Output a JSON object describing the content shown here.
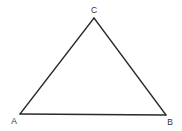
{
  "diagram": {
    "type": "triangle",
    "vertices": [
      {
        "label": "A",
        "x": 20,
        "y": 114,
        "label_x": 14,
        "label_y": 122
      },
      {
        "label": "B",
        "x": 166,
        "y": 115,
        "label_x": 170,
        "label_y": 123
      },
      {
        "label": "C",
        "x": 94,
        "y": 18,
        "label_x": 94,
        "label_y": 11
      }
    ],
    "edges": [
      {
        "from": "A",
        "to": "B"
      },
      {
        "from": "B",
        "to": "C"
      },
      {
        "from": "C",
        "to": "A"
      }
    ],
    "stroke_color": "#2a2a2a",
    "background": "#ffffff"
  }
}
